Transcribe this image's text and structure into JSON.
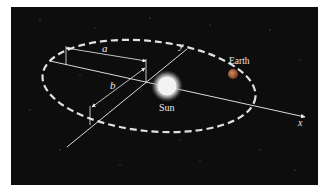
{
  "diagram": {
    "labels": {
      "semi_major_axis": "a",
      "semi_minor_axis": "b",
      "x_axis": "x",
      "y_axis": "y",
      "sun": "Sun",
      "earth": "Earth"
    },
    "colors": {
      "background": "#0d0d0d",
      "orbit": "#e0e0e0",
      "axes": "#f0f0f0",
      "sun": "#f5f5f5",
      "earth": "#b06040",
      "text": "#e8e8e8"
    }
  }
}
